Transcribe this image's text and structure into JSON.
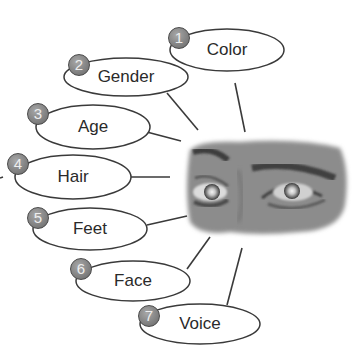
{
  "diagram": {
    "center_image": {
      "description": "grayscale photo of a pair of eyes",
      "x": 185,
      "y": 138,
      "width": 162,
      "height": 96
    },
    "colors": {
      "stroke": "#3a3a3a",
      "badge": "#8a8a8a",
      "badge_text": "#eeeeee",
      "text": "#2a2a2a",
      "background": "#ffffff"
    },
    "items": [
      {
        "number": "1",
        "label": "Color",
        "cx": 227,
        "cy": 50,
        "rx": 57,
        "ry": 21,
        "bx": 179,
        "by": 38,
        "line": [
          235,
          83,
          245,
          132
        ]
      },
      {
        "number": "2",
        "label": "Gender",
        "cx": 126,
        "cy": 77,
        "rx": 62,
        "ry": 19,
        "bx": 79,
        "by": 65,
        "line": [
          167,
          93,
          198,
          130
        ]
      },
      {
        "number": "3",
        "label": "Age",
        "cx": 93,
        "cy": 127,
        "rx": 57,
        "ry": 22,
        "bx": 38,
        "by": 114,
        "line": [
          143,
          131,
          181,
          141
        ]
      },
      {
        "number": "4",
        "label": "Hair",
        "cx": 73,
        "cy": 177,
        "rx": 58,
        "ry": 22,
        "bx": 18,
        "by": 164,
        "line": [
          131,
          177,
          170,
          177
        ]
      },
      {
        "number": "5",
        "label": "Feet",
        "cx": 90,
        "cy": 229,
        "rx": 57,
        "ry": 21,
        "bx": 38,
        "by": 218,
        "line": [
          147,
          225,
          187,
          216
        ]
      },
      {
        "number": "6",
        "label": "Face",
        "cx": 133,
        "cy": 281,
        "rx": 57,
        "ry": 20,
        "bx": 81,
        "by": 269,
        "line": [
          187,
          269,
          210,
          237
        ]
      },
      {
        "number": "7",
        "label": "Voice",
        "cx": 200,
        "cy": 324,
        "rx": 60,
        "ry": 20,
        "bx": 149,
        "by": 316,
        "line": [
          227,
          305,
          242,
          248
        ]
      }
    ]
  }
}
